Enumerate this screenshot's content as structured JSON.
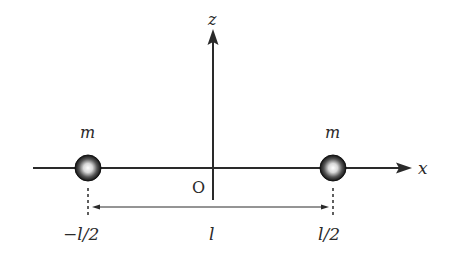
{
  "diagram": {
    "axes": {
      "x_label": "x",
      "z_label": "z",
      "origin_label": "O"
    },
    "masses": [
      {
        "label": "m",
        "position_label": "−l/2"
      },
      {
        "label": "m",
        "position_label": "l/2"
      }
    ],
    "separation_label": "l",
    "colors": {
      "line": "#2a2a2a",
      "background": "#ffffff"
    }
  }
}
